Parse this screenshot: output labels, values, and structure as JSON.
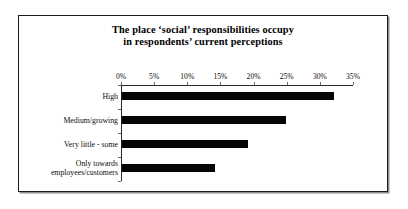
{
  "chart_data": {
    "type": "bar",
    "orientation": "horizontal",
    "title_lines": [
      "The place ‘social’ responsibilities occupy",
      "in respondents’ current perceptions"
    ],
    "categories": [
      "High",
      "Medium/growing",
      "Very little - some",
      "Only towards employees/customers"
    ],
    "category_lines": [
      [
        "High"
      ],
      [
        "Medium/growing"
      ],
      [
        "Very little - some"
      ],
      [
        "Only towards",
        "employees/customers"
      ]
    ],
    "values": [
      32,
      24.7,
      19,
      14
    ],
    "xlabel": "",
    "ylabel": "",
    "xlim": [
      0,
      35
    ],
    "tick_values": [
      0,
      5,
      10,
      15,
      20,
      25,
      30,
      35
    ],
    "tick_labels": [
      "0%",
      "5%",
      "10%",
      "15%",
      "20%",
      "25%",
      "30%",
      "35%"
    ],
    "grid": false,
    "legend": false,
    "bar_color": "#050505",
    "axis_color": "#2a2a2a",
    "value_axis_position": "top",
    "frame_color": "#1b1b1b",
    "background": "#ffffff"
  }
}
